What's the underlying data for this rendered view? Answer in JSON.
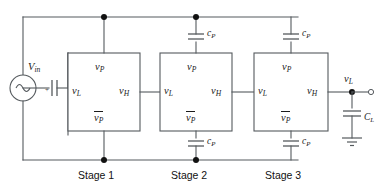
{
  "figure": {
    "kind": "circuit-schematic",
    "title": "",
    "line_color": "#555a5e",
    "node_color": "#111111",
    "text_color": "#1b1b1b",
    "background": "#ffffff"
  },
  "source": {
    "name": "voltage-source",
    "label_base": "V",
    "label_sub": "in",
    "symbol": "sine-source"
  },
  "input_coupling_cap": {
    "name": "input-series-capacitor",
    "label": "",
    "polarity_mark": "+"
  },
  "stages": [
    {
      "id": "stage1",
      "caption": "Stage 1",
      "ports": {
        "top": {
          "base": "v",
          "sub": "P",
          "overbar": false
        },
        "left": {
          "base": "v",
          "sub": "L",
          "overbar": false
        },
        "right": {
          "base": "v",
          "sub": "H",
          "overbar": false
        },
        "bottom": {
          "base": "v",
          "sub": "P",
          "overbar": true
        }
      },
      "top_cap": null,
      "bottom_cap": null
    },
    {
      "id": "stage2",
      "caption": "Stage 2",
      "ports": {
        "top": {
          "base": "v",
          "sub": "P",
          "overbar": false
        },
        "left": {
          "base": "v",
          "sub": "L",
          "overbar": false
        },
        "right": {
          "base": "v",
          "sub": "H",
          "overbar": false
        },
        "bottom": {
          "base": "v",
          "sub": "P",
          "overbar": true
        }
      },
      "top_cap": {
        "base": "c",
        "sub": "P"
      },
      "bottom_cap": {
        "base": "c",
        "sub": "P"
      }
    },
    {
      "id": "stage3",
      "caption": "Stage 3",
      "ports": {
        "top": {
          "base": "v",
          "sub": "P",
          "overbar": false
        },
        "left": {
          "base": "v",
          "sub": "L",
          "overbar": false
        },
        "right": {
          "base": "v",
          "sub": "H",
          "overbar": false
        },
        "bottom": {
          "base": "v",
          "sub": "P",
          "overbar": true
        }
      },
      "top_cap": {
        "base": "c",
        "sub": "P"
      },
      "bottom_cap": {
        "base": "c",
        "sub": "P"
      }
    }
  ],
  "output": {
    "node_label": {
      "base": "v",
      "sub": "L"
    },
    "terminal": "open-circle",
    "load_cap": {
      "base": "C",
      "sub": "L"
    },
    "ground": "earth-ground"
  },
  "labels": {
    "vin": "V",
    "vin_sub": "in",
    "vP": "v",
    "vP_sub": "P",
    "vL": "v",
    "vL_sub": "L",
    "vH": "v",
    "vH_sub": "H",
    "cP": "c",
    "cP_sub": "P",
    "CL": "C",
    "CL_sub": "L",
    "stage1": "Stage 1",
    "stage2": "Stage 2",
    "stage3": "Stage 3",
    "plus": "+"
  }
}
